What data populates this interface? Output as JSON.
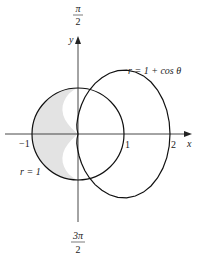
{
  "figure": {
    "curves": [
      {
        "name": "cardioid",
        "equation": "r = 1 + cos θ",
        "label": "r = 1 + cos θ"
      },
      {
        "name": "unit-circle",
        "equation": "r = 1",
        "label": "r = 1"
      }
    ],
    "shaded_region": "inside r = 1, outside r = 1 + cos θ (left side)",
    "colors": {
      "stroke": "#111111",
      "shade": "#e3e3e3",
      "axis": "#333333"
    }
  },
  "axes": {
    "x_label": "x",
    "y_label": "y",
    "top_angle_num": "π",
    "top_angle_den": "2",
    "bottom_angle_num": "3π",
    "bottom_angle_den": "2",
    "x_ticks": [
      "−1",
      "1",
      "2"
    ]
  },
  "labels": {
    "cardioid": "r = 1 + cos θ",
    "circle": "r = 1"
  }
}
